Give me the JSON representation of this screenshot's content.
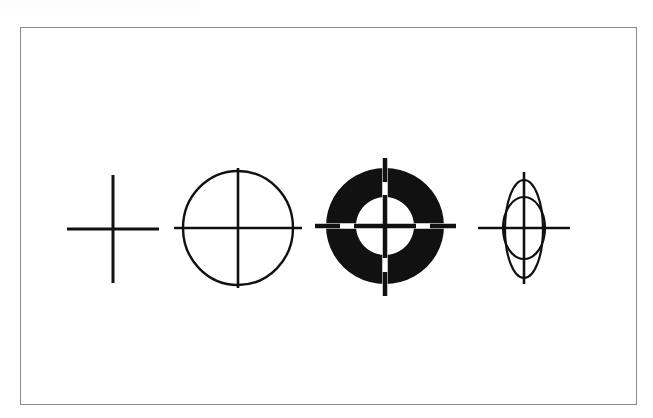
{
  "page": {
    "background_color": "#ffffff",
    "width": 653,
    "height": 418,
    "title": "Line drawing of four crosshair / target symbols"
  },
  "frame": {
    "name": "figure-border",
    "stroke_color": "#8b8b8b",
    "fill_color": "#ffffff",
    "x": 20,
    "y": 27,
    "width": 617,
    "height": 378,
    "stroke_width": 1
  },
  "diagram": {
    "stroke_color": "#111111",
    "fill_color": "#111111",
    "background_color": "#ffffff",
    "baseline_y": 228,
    "figure_count": 4,
    "figures": [
      {
        "id": "figure-1",
        "label": "plain cross",
        "center_x": 113,
        "center_y": 229,
        "cross": {
          "horizontal_half_length": 46,
          "vertical_half_length": 54,
          "stroke_width": 3
        },
        "ellipses": []
      },
      {
        "id": "figure-2",
        "label": "circle with inscribed cross",
        "center_x": 238,
        "center_y": 228,
        "cross": {
          "horizontal_half_length": 64,
          "vertical_half_length": 60,
          "stroke_width": 2.6
        },
        "ellipses": [
          {
            "rx": 55,
            "ry": 57,
            "filled": false,
            "stroke_width": 2.4
          }
        ]
      },
      {
        "id": "figure-3",
        "label": "filled ring target with white and black crosshairs",
        "center_x": 385,
        "center_y": 226,
        "cross": {
          "horizontal_half_length": 70,
          "vertical_half_length": 68,
          "stroke_width": 4.5
        },
        "white_cross_stroke_width": 5.5,
        "ellipses": [
          {
            "rx": 59,
            "ry": 58,
            "filled": true,
            "stroke_width": 0
          },
          {
            "rx": 29,
            "ry": 29,
            "filled": false,
            "hole": true,
            "stroke_width": 0
          }
        ]
      },
      {
        "id": "figure-4",
        "label": "narrow ellipse with inner circle and cross",
        "center_x": 524,
        "center_y": 228,
        "cross": {
          "horizontal_half_length": 46,
          "vertical_half_length": 56,
          "stroke_width": 2.6
        },
        "ellipses": [
          {
            "rx": 19,
            "ry": 49,
            "filled": false,
            "stroke_width": 2.2
          },
          {
            "rx": 21,
            "ry": 31,
            "filled": false,
            "stroke_width": 2.2
          }
        ]
      }
    ]
  }
}
